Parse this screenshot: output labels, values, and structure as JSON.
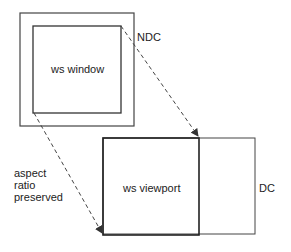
{
  "diagram": {
    "labels": {
      "ndc": "NDC",
      "ws_window": "ws window",
      "ws_viewport": "ws viewport",
      "dc": "DC",
      "aspect_line1": "aspect",
      "aspect_line2": "ratio",
      "aspect_line3": "preserved"
    },
    "colors": {
      "line": "#333333",
      "background": "#ffffff"
    }
  }
}
